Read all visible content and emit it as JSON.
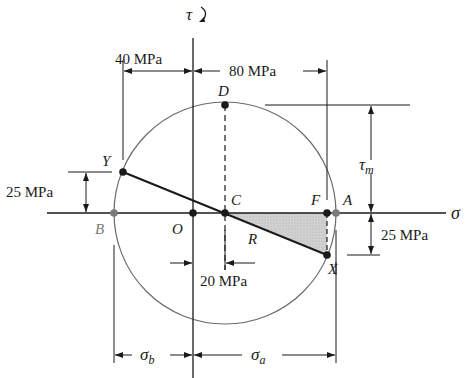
{
  "diagram": {
    "axes": {
      "sigma_label": "σ",
      "tau_label": "τ",
      "tau_arrow_icon": "clockwise-arrow"
    },
    "points": {
      "O": "O",
      "C": "C",
      "D": "D",
      "A": "A",
      "B": "B",
      "F": "F",
      "X": "X",
      "Y": "Y"
    },
    "segment_labels": {
      "R": "R"
    },
    "dimensions": {
      "left_40": "40 MPa",
      "top_80": "80 MPa",
      "left_25": "25 MPa",
      "right_25": "25 MPa",
      "bottom_20": "20 MPa",
      "tau_m": "τ",
      "tau_m_sub": "m",
      "sigma_b": "σ",
      "sigma_b_sub": "b",
      "sigma_a": "σ",
      "sigma_a_sub": "a"
    },
    "colors": {
      "line": "#1a1a1a",
      "circle": "#6a6a6a",
      "shade": "#c8c8c8",
      "gray_point": "#7a7a7a"
    }
  }
}
